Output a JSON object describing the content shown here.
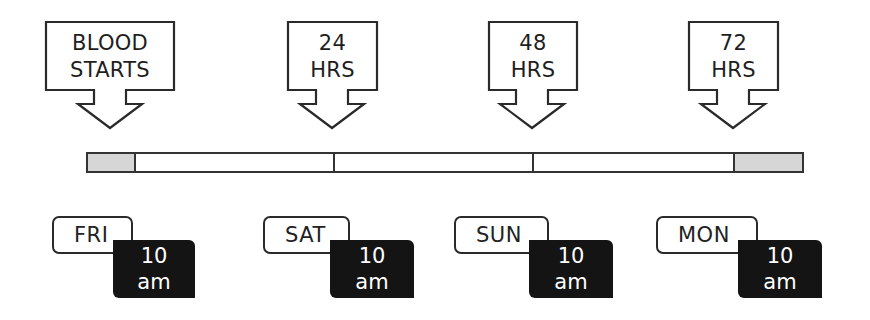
{
  "diagram": {
    "type": "timeline",
    "colors": {
      "outline": "#2a2a2a",
      "gray_segment": "#d6d6d6",
      "time_box_bg": "#141414",
      "time_box_text": "#ffffff"
    },
    "callouts": [
      {
        "line1": "BLOOD",
        "line2": "STARTS"
      },
      {
        "line1": "24",
        "line2": "HRS"
      },
      {
        "line1": "48",
        "line2": "HRS"
      },
      {
        "line1": "72",
        "line2": "HRS"
      }
    ],
    "bar": {
      "segments": [
        "start-shaded",
        "day-1",
        "day-2",
        "day-3",
        "end-shaded"
      ]
    },
    "days": [
      {
        "day": "FRI",
        "time_num": "10",
        "time_unit": "am"
      },
      {
        "day": "SAT",
        "time_num": "10",
        "time_unit": "am"
      },
      {
        "day": "SUN",
        "time_num": "10",
        "time_unit": "am"
      },
      {
        "day": "MON",
        "time_num": "10",
        "time_unit": "am"
      }
    ]
  }
}
